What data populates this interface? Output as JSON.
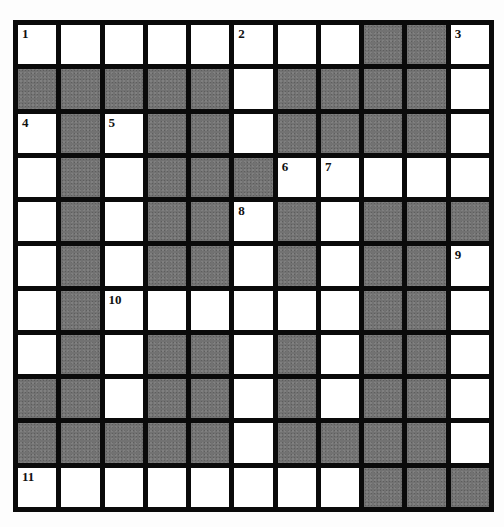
{
  "puzzle": {
    "type": "crossword",
    "rows": 11,
    "cols": 11,
    "colors": {
      "block": "#727272",
      "white": "#ffffff",
      "border": "#0a0a0a"
    },
    "layout": [
      "WWWWWWWWBBW",
      "BBBBBWBBBBW",
      "WBWBBWBBBBW",
      "WBWBBBWWWWW",
      "WBWBBWBWBBB",
      "WBWBBWBWBBW",
      "WBWWWWWWBBW",
      "WBWBBWBWBBW",
      "BBWBBWBWBBW",
      "BBBBBWBBBBW",
      "WWWWWWWWBBB"
    ],
    "numbers": [
      {
        "row": 0,
        "col": 0,
        "label": "1"
      },
      {
        "row": 0,
        "col": 5,
        "label": "2"
      },
      {
        "row": 0,
        "col": 10,
        "label": "3"
      },
      {
        "row": 2,
        "col": 0,
        "label": "4"
      },
      {
        "row": 2,
        "col": 2,
        "label": "5"
      },
      {
        "row": 3,
        "col": 6,
        "label": "6"
      },
      {
        "row": 3,
        "col": 7,
        "label": "7"
      },
      {
        "row": 4,
        "col": 5,
        "label": "8"
      },
      {
        "row": 5,
        "col": 10,
        "label": "9"
      },
      {
        "row": 6,
        "col": 2,
        "label": "10"
      },
      {
        "row": 10,
        "col": 0,
        "label": "11"
      }
    ]
  }
}
